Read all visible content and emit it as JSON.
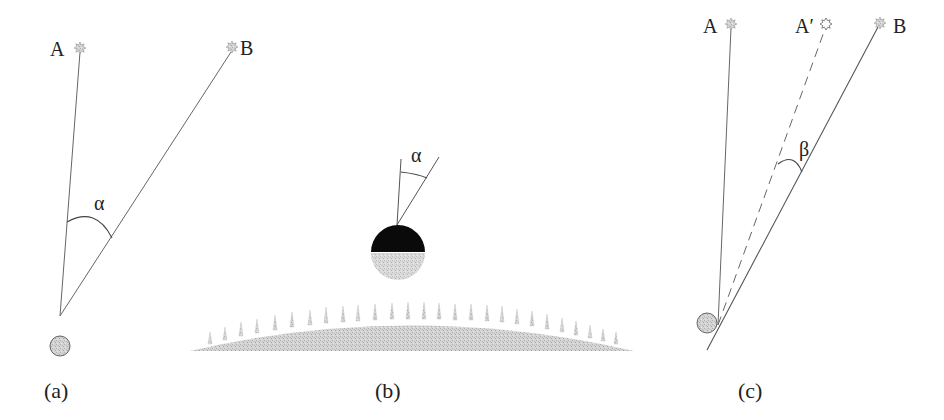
{
  "figure": {
    "panels": [
      {
        "id": "a",
        "caption": "(a)",
        "stars": [
          {
            "label": "A",
            "x": 80,
            "y": 48
          },
          {
            "label": "B",
            "x": 232,
            "y": 47
          }
        ],
        "angle_label": "α",
        "observer": {
          "x": 60,
          "y": 346
        }
      },
      {
        "id": "b",
        "caption": "(b)",
        "angle_label": "α",
        "moon": {
          "x": 397,
          "y": 250
        }
      },
      {
        "id": "c",
        "caption": "(c)",
        "stars": [
          {
            "label": "A",
            "x": 731,
            "y": 24
          },
          {
            "label": "A′",
            "x": 826,
            "y": 24
          },
          {
            "label": "B",
            "x": 880,
            "y": 23
          }
        ],
        "angle_label": "β",
        "observer": {
          "x": 707,
          "y": 323
        }
      }
    ],
    "colors": {
      "line": "#555555",
      "star_fill": "#b8b8b8",
      "body_gray": "#c8c8c8",
      "moon_dark": "#0a0a0a",
      "ground": "#cfcfcf"
    }
  }
}
